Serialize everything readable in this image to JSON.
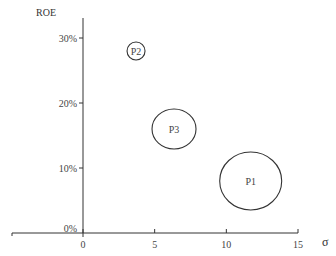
{
  "chart_data": {
    "type": "scatter",
    "subtype": "bubble",
    "title": "",
    "xlabel": "σ",
    "ylabel": "ROE",
    "xlim": [
      0,
      15
    ],
    "ylim": [
      0,
      32
    ],
    "x_ticks": [
      0,
      5,
      10,
      15
    ],
    "x_tick_labels": [
      "0",
      "5",
      "10",
      "15"
    ],
    "y_ticks": [
      0,
      10,
      20,
      30
    ],
    "y_tick_labels": [
      "0%",
      "10%",
      "20%",
      "30%"
    ],
    "grid": false,
    "legend": null,
    "points": [
      {
        "label": "P1",
        "x": 11.7,
        "y": 8,
        "size": 30
      },
      {
        "label": "P2",
        "x": 3.7,
        "y": 28,
        "size": 9
      },
      {
        "label": "P3",
        "x": 6.35,
        "y": 16,
        "size": 21
      }
    ]
  },
  "axes": {
    "y_title": "ROE",
    "x_title": "σ"
  },
  "colors": {
    "stroke": "#333333",
    "text": "#444444",
    "background": "#ffffff"
  }
}
